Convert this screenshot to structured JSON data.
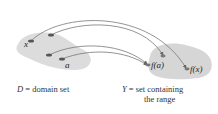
{
  "diagram": {
    "domain_points": {
      "x": "x",
      "a": "a"
    },
    "range_points": {
      "fa": "f(a)",
      "fx": "f(x)"
    },
    "captions": {
      "domain": {
        "symbol": "D",
        "equals": " = ",
        "text": "domain set"
      },
      "range": {
        "symbol": "Y",
        "equals": " = ",
        "line1": "set containing",
        "line2": "the range"
      }
    },
    "colors": {
      "blob": "#d8d8d8",
      "arrow": "#777777",
      "point": "#555555"
    }
  }
}
